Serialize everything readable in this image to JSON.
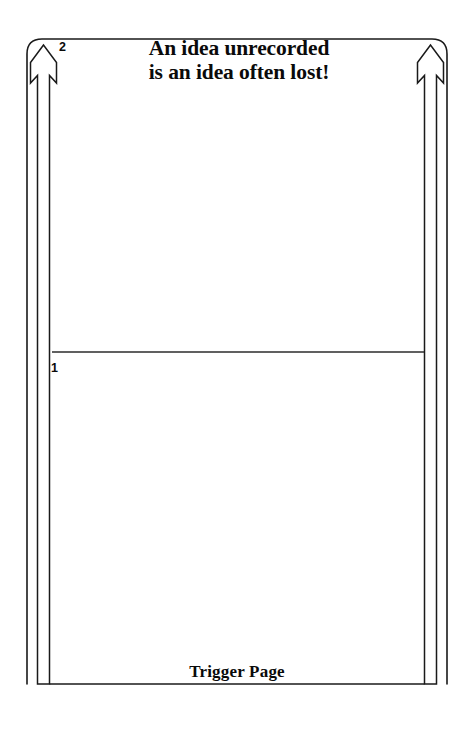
{
  "page": {
    "background_color": "#ffffff",
    "ink_color": "#000000"
  },
  "heading": {
    "line1": "An idea unrecorded",
    "line2": "is an idea often lost!"
  },
  "footer": {
    "title": "Trigger Page"
  },
  "sections": [
    {
      "number": "2",
      "position": "top"
    },
    {
      "number": "1",
      "position": "middle"
    }
  ],
  "icons": {
    "left_arrow": "arrow-up-outline-icon",
    "right_arrow": "arrow-up-outline-icon"
  },
  "regions": {
    "upper_note_area": "",
    "lower_note_area": ""
  }
}
